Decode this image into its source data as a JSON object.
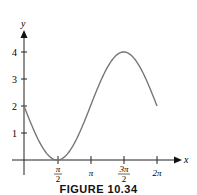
{
  "chart_data": {
    "type": "line",
    "title": "",
    "function": "y = 2 - 2 sin(x)",
    "xlabel": "x",
    "ylabel": "y",
    "x_range": [
      0,
      6.2832
    ],
    "ylim": [
      0,
      4
    ],
    "x_ticks": [
      {
        "value": 1.5708,
        "label_num": "π",
        "label_den": "2"
      },
      {
        "value": 3.1416,
        "label": "π"
      },
      {
        "value": 4.7124,
        "label_num": "3π",
        "label_den": "2"
      },
      {
        "value": 6.2832,
        "label": "2π"
      }
    ],
    "y_ticks": [
      {
        "value": 1,
        "label": "1"
      },
      {
        "value": 2,
        "label": "2"
      },
      {
        "value": 3,
        "label": "3"
      },
      {
        "value": 4,
        "label": "4"
      }
    ],
    "key_points": [
      {
        "x": 0,
        "y": 2
      },
      {
        "x": 1.5708,
        "y": 0
      },
      {
        "x": 3.1416,
        "y": 2
      },
      {
        "x": 4.7124,
        "y": 4
      },
      {
        "x": 6.2832,
        "y": 2
      }
    ],
    "grid": false,
    "curve_color": "#777777"
  },
  "caption": "FIGURE 10.34"
}
